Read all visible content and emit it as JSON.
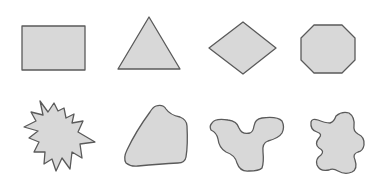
{
  "figure": {
    "background": "#ffffff",
    "fill": "#d8d8d8",
    "stroke": "#5a5a5a",
    "stroke_width": 1.3
  },
  "rows": [
    {
      "label": "regular",
      "shapes": [
        {
          "name": "rectangle",
          "points": "22,26 85,26 85,70 22,70"
        },
        {
          "name": "triangle",
          "points": "149,17 180,69 118,69"
        },
        {
          "name": "diamond",
          "points": "243,22 276,48 243,74 209,48"
        },
        {
          "name": "octagon",
          "points": "314,25 342,25 355,38 355,60 342,73 314,73 301,60 301,38"
        }
      ]
    },
    {
      "label": "irregular",
      "shapes": [
        {
          "name": "starburst",
          "points": "40,101 48,112 54,103 58,111 64,108 66,118 74,114 72,123 83,121 78,132 95,142 80,144 82,158 72,152 70,169 62,158 56,171 52,159 44,164 45,152 34,152 39,142 29,138 38,131 24,127 36,121 31,112 43,115"
        },
        {
          "name": "rounded-polygon",
          "path": "M156,106 Q163,104 166,109 Q170,115 180,117 Q187,120 187,126 Q188,145 186,157 Q185,163 178,163 Q160,164 138,166 Q131,167 126,163 Q123,158 127,150 Q136,131 150,112 Q153,107 156,106 Z"
        },
        {
          "name": "blob-irregular-1",
          "path": "M212,123 Q215,118 228,120 Q237,121 239,128 Q242,135 250,133 Q253,132 254,126 Q255,119 262,118 Q277,116 282,121 Q285,127 282,133 Q279,138 268,141 Q262,143 263,152 Q264,162 262,168 Q259,171 249,171 Q240,172 237,163 Q235,155 226,152 Q219,148 218,139 Q217,133 211,130 Q209,126 212,123 Z"
        },
        {
          "name": "blob-irregular-2",
          "path": "M336,116 Q342,111 349,113 Q355,117 354,126 Q353,131 358,134 Q365,137 364,145 Q363,151 358,152 Q352,154 355,160 Q358,169 352,172 Q345,175 338,171 Q333,168 329,170 Q320,172 317,165 Q315,159 321,155 Q325,151 319,148 Q314,144 319,138 Q323,134 317,132 Q310,130 311,122 Q312,118 318,120 Q325,123 330,123 Q334,122 336,116 Z"
        }
      ]
    }
  ]
}
